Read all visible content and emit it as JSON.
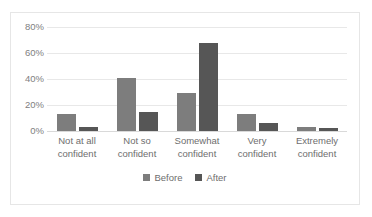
{
  "chart_data": {
    "type": "bar",
    "title": "",
    "subtitle": "",
    "xlabel": "",
    "ylabel": "",
    "ylim": [
      0,
      80
    ],
    "ytick_labels": [
      "0%",
      "20%",
      "40%",
      "60%",
      "80%"
    ],
    "ytick_values": [
      0,
      20,
      40,
      60,
      80
    ],
    "grid": true,
    "legend_position": "bottom",
    "categories": [
      "Not at all\nconfident",
      "Not so\nconfident",
      "Somewhat\nconfident",
      "Very\nconfident",
      "Extremely\nconfident"
    ],
    "series": [
      {
        "name": "Before",
        "color": "#7d7d7d",
        "values": [
          13,
          41,
          29,
          13,
          3
        ]
      },
      {
        "name": "After",
        "color": "#565656",
        "values": [
          3,
          15,
          68,
          6,
          2
        ]
      }
    ]
  },
  "legend": {
    "entries": [
      {
        "label": "Before"
      },
      {
        "label": "After"
      }
    ]
  },
  "colors": {
    "before": "#7d7d7d",
    "after": "#565656",
    "gridline": "#e8e8e8",
    "border": "#e6e6e6",
    "text": "#6e6e6e",
    "background": "#ffffff"
  }
}
